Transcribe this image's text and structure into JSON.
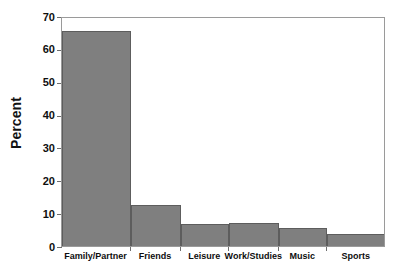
{
  "chart_data": {
    "type": "bar",
    "title": "",
    "subtitle": "",
    "xlabel": "",
    "ylabel": "Percent",
    "categories": [
      "Family/Partner",
      "Friends",
      "Leisure",
      "Work/Studies",
      "Music",
      "Sports"
    ],
    "values": [
      65.4,
      12.6,
      6.7,
      6.9,
      5.4,
      3.6
    ],
    "ylim": [
      0,
      70
    ],
    "ytick_labels": [
      "0",
      "10",
      "20",
      "30",
      "40",
      "50",
      "60",
      "70"
    ],
    "ytick_values": [
      0,
      10,
      20,
      30,
      40,
      50,
      60,
      70
    ],
    "grid": false,
    "legend": false,
    "legend_position": "none",
    "bar_color": "#7f7f7f",
    "bar_edge_color": "#5d5d5d",
    "axis_color": "#9a9a9a",
    "background_color": "#ffffff",
    "bars_contiguous": true,
    "bar_widths_relative": [
      0.213,
      0.155,
      0.148,
      0.155,
      0.148,
      0.181
    ]
  },
  "axes": {
    "y_title": "Percent"
  }
}
